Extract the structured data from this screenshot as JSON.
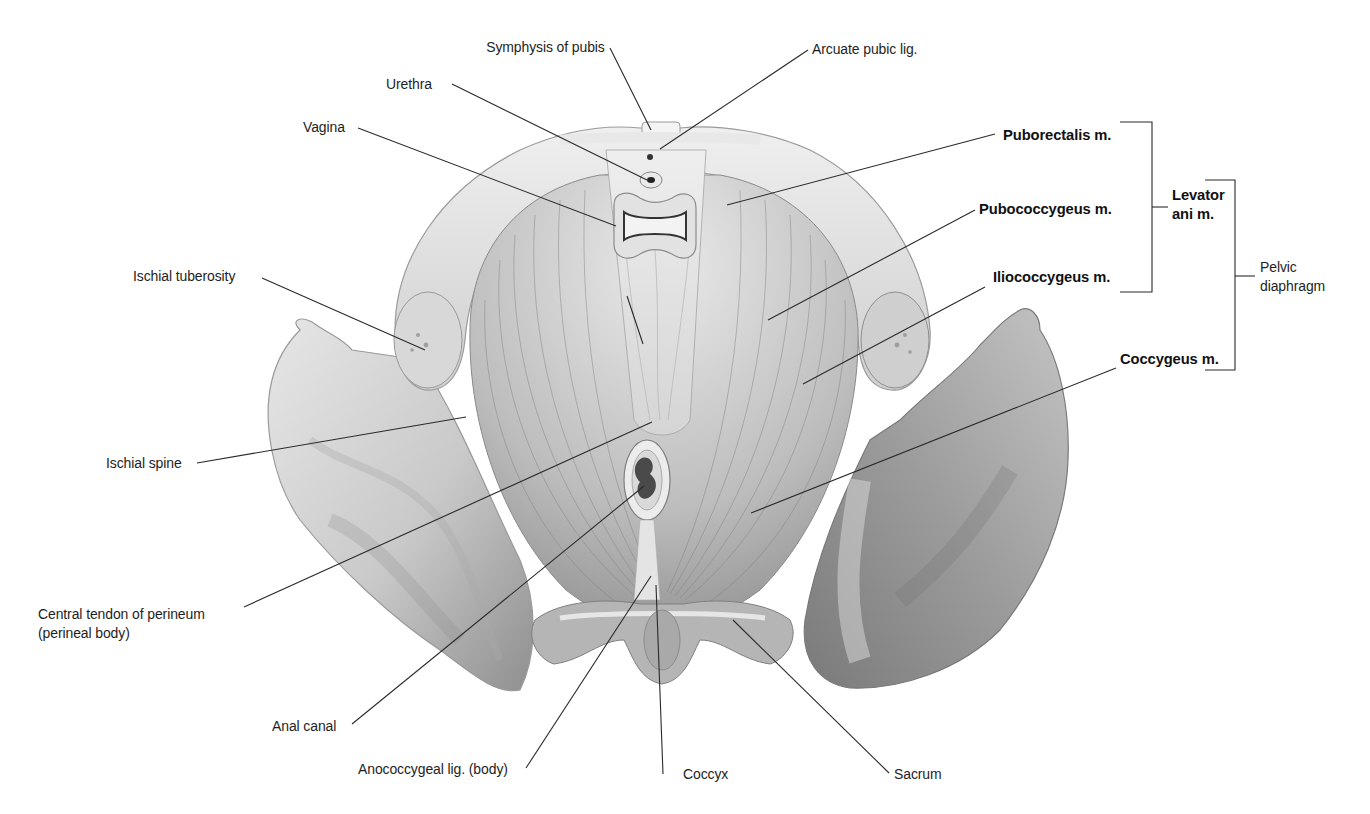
{
  "figure": {
    "labels": {
      "symphysis_of_pubis": "Symphysis of pubis",
      "arcuate_pubic_lig": "Arcuate pubic lig.",
      "urethra": "Urethra",
      "vagina": "Vagina",
      "ischial_tuberosity": "Ischial tuberosity",
      "ischial_spine": "Ischial spine",
      "central_tendon_line1": "Central tendon of perineum",
      "central_tendon_line2": "(perineal body)",
      "anal_canal": "Anal canal",
      "anococcygeal_lig": "Anococcygeal lig. (body)",
      "coccyx": "Coccyx",
      "sacrum": "Sacrum",
      "puborectalis": "Puborectalis m.",
      "pubococcygeus": "Pubococcygeus m.",
      "iliococcygeus": "Iliococcygeus m.",
      "coccygeus": "Coccygeus m.",
      "levator_ani_line1": "Levator",
      "levator_ani_line2": "ani m.",
      "pelvic_diaphragm_line1": "Pelvic",
      "pelvic_diaphragm_line2": "diaphragm"
    },
    "groups": [
      {
        "name": "Levator ani m.",
        "members": [
          "Puborectalis m.",
          "Pubococcygeus m.",
          "Iliococcygeus m."
        ]
      },
      {
        "name": "Pelvic diaphragm",
        "members": [
          "Levator ani m.",
          "Coccygeus m."
        ]
      }
    ]
  }
}
